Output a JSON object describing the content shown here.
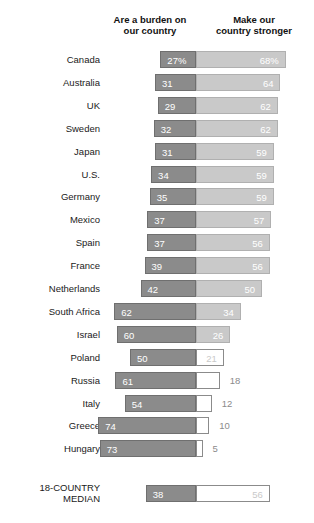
{
  "headers": {
    "left": "Are a burden on\nour country",
    "right": "Make our\ncountry stronger"
  },
  "median_label": "18-COUNTRY\nMEDIAN",
  "colors": {
    "burden_fill": "#8b8b8b",
    "stronger_fill": "#c9c9c9",
    "hollow_fill": "#ffffff",
    "background": "#ffffff",
    "text": "#1a1a1a",
    "dim_text": "#8b8b8b"
  },
  "chart_data": {
    "type": "bar",
    "subtype": "diverging-butterfly",
    "title": "",
    "xlabel": "",
    "ylabel": "",
    "grid": false,
    "legend_position": "top",
    "center_axis_value": 0,
    "categories": [
      "Canada",
      "Australia",
      "UK",
      "Sweden",
      "Japan",
      "U.S.",
      "Germany",
      "Mexico",
      "Spain",
      "France",
      "Netherlands",
      "South Africa",
      "Israel",
      "Poland",
      "Russia",
      "Italy",
      "Greece",
      "Hungary"
    ],
    "series": [
      {
        "name": "Are a burden on our country",
        "values": [
          27,
          31,
          29,
          32,
          31,
          34,
          35,
          37,
          37,
          39,
          42,
          62,
          60,
          50,
          61,
          54,
          74,
          73
        ]
      },
      {
        "name": "Make our country stronger",
        "values": [
          68,
          64,
          62,
          62,
          59,
          59,
          59,
          57,
          56,
          56,
          50,
          34,
          26,
          21,
          18,
          12,
          10,
          5
        ]
      }
    ],
    "value_labels": {
      "burden": [
        "27%",
        "31",
        "29",
        "32",
        "31",
        "34",
        "35",
        "37",
        "37",
        "39",
        "42",
        "62",
        "60",
        "50",
        "61",
        "54",
        "74",
        "73"
      ],
      "stronger": [
        "68%",
        "64",
        "62",
        "62",
        "59",
        "59",
        "59",
        "57",
        "56",
        "56",
        "50",
        "34",
        "26",
        "21",
        "18",
        "12",
        "10",
        "5"
      ]
    },
    "median_row": {
      "label": "18-COUNTRY MEDIAN",
      "burden": 38,
      "stronger": 56,
      "burden_label": "38",
      "stronger_label": "56"
    }
  }
}
